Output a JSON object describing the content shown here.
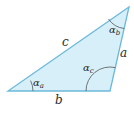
{
  "diagram": {
    "type": "triangle",
    "colors": {
      "fill": "#d6eff8",
      "stroke": "#6cb9da",
      "arc": "#555555",
      "text": "#2b2b2b"
    },
    "vertices": {
      "A": {
        "x": 8,
        "y": 91
      },
      "B": {
        "x": 110,
        "y": 91
      },
      "C": {
        "x": 129,
        "y": 7
      }
    },
    "sides": {
      "a": {
        "label": "a"
      },
      "b": {
        "label": "b"
      },
      "c": {
        "label": "c"
      }
    },
    "angles": {
      "alpha_a": {
        "symbol": "α",
        "subscript": "a"
      },
      "alpha_b": {
        "symbol": "α",
        "subscript": "b"
      },
      "alpha_c": {
        "symbol": "α",
        "subscript": "c"
      }
    }
  }
}
